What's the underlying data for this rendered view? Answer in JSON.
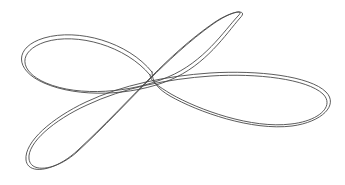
{
  "figure": {
    "background_color": "#ffffff",
    "stroke_color": "#4a4a4a",
    "stroke_width": "0.9",
    "canvas": {
      "width": 345,
      "height": 185
    },
    "style": "line-drawing",
    "double_stroked": "true",
    "offset_pixels": "2",
    "lobes": [
      {
        "name": "upper-left-lobe",
        "tip_x": 20,
        "tip_y": 57,
        "tilt_degrees": -12,
        "length": 150
      },
      {
        "name": "upper-right-lobe",
        "tip_x": 243,
        "tip_y": 15,
        "tilt_degrees": -38,
        "length": 118
      },
      {
        "name": "lower-left-lobe",
        "tip_x": 28,
        "tip_y": 170,
        "tilt_degrees": 40,
        "length": 160
      },
      {
        "name": "right-lobe",
        "tip_x": 330,
        "tip_y": 100,
        "tilt_degrees": 8,
        "length": 185
      }
    ],
    "crossing_center": {
      "x": 152,
      "y": 76
    },
    "paths": {
      "outer_trace": "M 152 72 C 128 42 78 28 44 38 C 14 47 14 70 44 83 C 78 98 132 96 170 80 C 206 65 226 34 240 18 C 249 9 233 10 215 22 C 190 39 168 60 152 76 C 134 94 104 126 78 150 C 56 171 28 176 26 160 C 24 142 52 118 86 102 C 122 85 166 76 210 73 C 258 70 310 76 326 92 C 339 105 322 122 292 126 C 252 131 198 112 170 96 C 158 89 152 82 152 72 Z",
      "inner_trace": "M 150 75 C 126 46 77 32 45 42 C 18 51 18 71 46 83 C 79 97 131 93 168 77 C 204 62 224 31 238 16 C 246 8 230 12 213 24 C 189 41 166 63 150 79 C 132 97 102 129 77 152 C 57 170 31 174 29 159 C 27 143 54 120 87 105 C 123 88 167 79 211 76 C 257 73 307 79 323 94 C 335 106 319 121 291 124 C 252 129 199 110 171 94 C 158 86 150 81 150 75 Z"
    }
  }
}
